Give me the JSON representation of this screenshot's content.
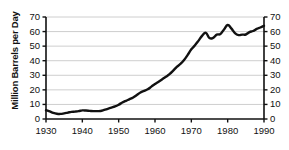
{
  "chart_data": {
    "type": "line",
    "title": "",
    "xlabel": "",
    "ylabel": "Million Barrels per Day",
    "xlim": [
      1930,
      1990
    ],
    "ylim": [
      0,
      70
    ],
    "grid": true,
    "legend": "none",
    "y_ticks": [
      0,
      10,
      20,
      30,
      40,
      50,
      60,
      70
    ],
    "y_tick_labels": [
      "0",
      "10",
      "20",
      "30",
      "40",
      "50",
      "60",
      "70"
    ],
    "y_ticks_right": [
      0,
      10,
      20,
      30,
      40,
      50,
      60,
      70
    ],
    "y_tick_labels_right": [
      "0",
      "10",
      "20",
      "30",
      "40",
      "50",
      "60",
      "70"
    ],
    "x_ticks": [
      1930,
      1940,
      1950,
      1960,
      1970,
      1980,
      1990
    ],
    "x_tick_labels": [
      "1930",
      "1940",
      "1950",
      "1960",
      "1970",
      "1980",
      "1990"
    ],
    "line_color": "#111111",
    "grid_color": "#c8c8c8",
    "axis_color": "#111111",
    "x": [
      1930,
      1931,
      1932,
      1933,
      1934,
      1935,
      1936,
      1937,
      1938,
      1939,
      1940,
      1941,
      1942,
      1943,
      1944,
      1945,
      1946,
      1947,
      1948,
      1949,
      1950,
      1951,
      1952,
      1953,
      1954,
      1955,
      1956,
      1957,
      1958,
      1959,
      1960,
      1961,
      1962,
      1963,
      1964,
      1965,
      1966,
      1967,
      1968,
      1969,
      1970,
      1971,
      1972,
      1973,
      1974,
      1975,
      1976,
      1977,
      1978,
      1979,
      1980,
      1981,
      1982,
      1983,
      1984,
      1985,
      1986,
      1987,
      1988,
      1989,
      1990
    ],
    "y": [
      6.0,
      5.2,
      4.2,
      3.6,
      3.5,
      3.9,
      4.4,
      4.9,
      5.1,
      5.4,
      5.9,
      5.8,
      5.6,
      5.4,
      5.4,
      5.5,
      6.2,
      7.0,
      7.8,
      8.6,
      9.8,
      11.3,
      12.5,
      13.6,
      14.8,
      16.5,
      18.2,
      19.3,
      20.4,
      22.2,
      24.0,
      25.6,
      27.3,
      29.0,
      30.8,
      33.2,
      35.8,
      37.8,
      40.5,
      44.0,
      47.8,
      50.6,
      53.8,
      57.2,
      59.1,
      55.6,
      55.7,
      57.9,
      58.3,
      61.5,
      64.5,
      62.2,
      59.0,
      57.6,
      57.9,
      58.0,
      59.6,
      60.4,
      61.8,
      62.8,
      64.0
    ],
    "annotations": []
  },
  "layout": {
    "plot_left": 46,
    "plot_right": 264,
    "plot_top": 17,
    "plot_bottom": 119
  }
}
